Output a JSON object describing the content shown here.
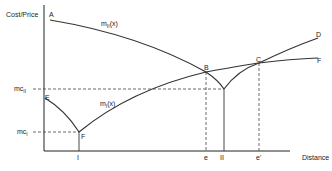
{
  "diagram": {
    "y_axis_label": "Cost/Price",
    "x_axis_label": "Distance",
    "curves": [
      {
        "name": "m_II(x)",
        "label_main": "m",
        "label_sub": "II",
        "label_suffix": "(x)",
        "from": "A",
        "to": "D"
      },
      {
        "name": "m_I(x)",
        "label_main": "m",
        "label_sub": "I",
        "label_suffix": "(x)",
        "from": "E",
        "to": "F"
      }
    ],
    "points": {
      "A": "A",
      "B": "B",
      "C": "C",
      "D": "D",
      "E": "E",
      "F_top": "F",
      "F_low": "F"
    },
    "y_ticks": [
      {
        "main": "mc",
        "sub": "II"
      },
      {
        "main": "mc",
        "sub": "I"
      }
    ],
    "x_ticks": [
      "I",
      "e",
      "II",
      "e'"
    ]
  }
}
